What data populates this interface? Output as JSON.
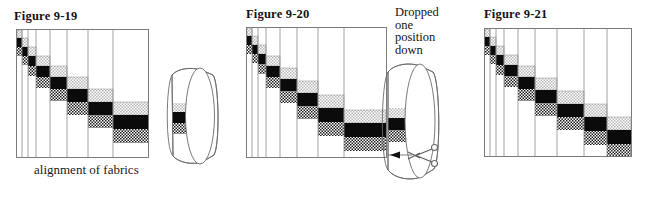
{
  "page": {
    "background_color": "#ffffff",
    "width": 660,
    "height": 200
  },
  "palette": {
    "ink": "#1a1a1a",
    "grid_line": "#8a8a8a",
    "frame_line": "#6e6e6e",
    "fabric_black": "#0b0b0b",
    "fabric_stipple": "#d9d9d9",
    "fabric_hatch": "#4a4a4a",
    "paper": "#ffffff"
  },
  "figures": [
    {
      "id": "figure-9-19",
      "title": "Figure 9-19",
      "caption": "alignment of fabrics",
      "has_ring": true,
      "has_scissors": false,
      "note": null,
      "columns": 9,
      "strip_sequence": [
        "stipple",
        "black",
        "hatch"
      ],
      "description": "Strip-pieced panel with fabrics aligned in a descending diagonal stair-step; tube/ring at right shows matched fabric bands"
    },
    {
      "id": "figure-9-20",
      "title": "Figure 9-20",
      "caption": null,
      "has_ring": true,
      "has_scissors": true,
      "note": [
        "Dropped",
        "one",
        "position",
        "down"
      ],
      "columns": 9,
      "strip_sequence": [
        "stipple",
        "black",
        "hatch"
      ],
      "description": "Same panel with the diagonal dropped one position down; scissors and arrow mark the cutting point on the tube"
    },
    {
      "id": "figure-9-21",
      "title": "Figure 9-21",
      "caption": null,
      "has_ring": false,
      "has_scissors": false,
      "note": null,
      "columns": 9,
      "strip_sequence": [
        "stipple",
        "black",
        "hatch"
      ],
      "description": "Flat strip-pieced panel with the stair-step diagonal, no tube shown"
    }
  ],
  "legend": {
    "fabric_names": [
      "stipple",
      "black",
      "hatch"
    ]
  }
}
